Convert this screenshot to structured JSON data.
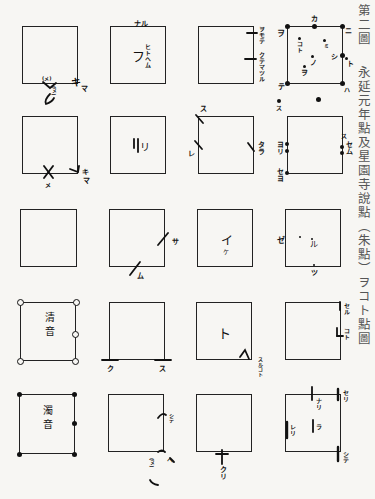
{
  "caption": {
    "figure_number": "第二圖",
    "title": "永延元年點及星園寺說點（朱點）ヲコト點圖"
  },
  "grid": {
    "rows": 5,
    "columns": 4,
    "cells": [
      {
        "row": 1,
        "col": 1,
        "center": "",
        "labels": [
          "(メ)",
          "キ",
          "マ",
          "(ヌ)"
        ]
      },
      {
        "row": 1,
        "col": 2,
        "center": "フ",
        "labels": [
          "ナル",
          "ヒトヘム"
        ]
      },
      {
        "row": 1,
        "col": 3,
        "center": "",
        "labels": [
          "ヲモテ",
          "クテマツル"
        ]
      },
      {
        "row": 1,
        "col": 4,
        "center": "",
        "labels": [
          "カ",
          "ニ",
          "ヲ",
          "コト",
          "ミ",
          "ノ",
          "シ",
          "ヲ",
          "テ",
          "ト",
          "ハ",
          "ス"
        ]
      },
      {
        "row": 2,
        "col": 1,
        "center": "",
        "labels": [
          "メ",
          "キ",
          "マ"
        ]
      },
      {
        "row": 2,
        "col": 2,
        "center": "リ",
        "labels": []
      },
      {
        "row": 2,
        "col": 3,
        "center": "",
        "labels": [
          "ス",
          "レ",
          "タラ"
        ]
      },
      {
        "row": 2,
        "col": 4,
        "center": "",
        "labels": [
          "ヨリ",
          "セヨ",
          "セム",
          "ス"
        ]
      },
      {
        "row": 3,
        "col": 1,
        "center": "",
        "labels": []
      },
      {
        "row": 3,
        "col": 2,
        "center": "",
        "labels": [
          "サ",
          "ム"
        ]
      },
      {
        "row": 3,
        "col": 3,
        "center": "イ",
        "center_sub": "ケ",
        "labels": []
      },
      {
        "row": 3,
        "col": 4,
        "center": "ル",
        "labels": [
          "ゼ",
          "ツ"
        ]
      },
      {
        "row": 4,
        "col": 1,
        "center": "清音",
        "labels": []
      },
      {
        "row": 4,
        "col": 2,
        "center": "",
        "labels": [
          "ク",
          "ス"
        ]
      },
      {
        "row": 4,
        "col": 3,
        "center": "ト",
        "labels": [
          "スルコト"
        ]
      },
      {
        "row": 4,
        "col": 4,
        "center": "",
        "labels": [
          "セル",
          "コト"
        ]
      },
      {
        "row": 5,
        "col": 1,
        "center": "濁音",
        "labels": []
      },
      {
        "row": 5,
        "col": 2,
        "center": "",
        "labels": [
          "シテ",
          "(ヌ)",
          "ヘ"
        ]
      },
      {
        "row": 5,
        "col": 3,
        "center": "",
        "labels": [
          "クリ"
        ]
      },
      {
        "row": 5,
        "col": 4,
        "center": "",
        "labels": [
          "ナリ",
          "ラ",
          "レリ",
          "セリ",
          "シテ"
        ]
      }
    ]
  }
}
